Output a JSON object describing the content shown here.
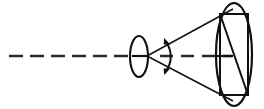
{
  "figure": {
    "background_color": "#ffffff",
    "stroke_color": "#111111",
    "axis_color": "#2b2b2b",
    "width": 264,
    "height": 109
  },
  "elements": {
    "optical_axis": {
      "name": "optical-axis",
      "style": "dashed",
      "dash_length": 14,
      "gap_length": 7,
      "stroke_width": 2.4,
      "y": 56,
      "x_start": 9,
      "x_end": 132
    },
    "axis_right_segment": {
      "name": "optical-axis-right",
      "style": "dashed",
      "dash_length": 13,
      "gap_length": 8,
      "stroke_width": 2.4,
      "y": 56,
      "x_start": 160,
      "x_end": 232
    },
    "lens": {
      "name": "lens-ellipse",
      "cx": 139,
      "cy": 56.5,
      "rx": 9,
      "ry": 20.5,
      "stroke_width": 2.1
    },
    "lens_center_tick": {
      "name": "lens-center-tick",
      "x1": 132,
      "x2": 149,
      "y": 56,
      "stroke_width": 2.2
    },
    "apex": {
      "name": "cone-apex",
      "x": 147,
      "y": 56
    },
    "cone_upper_edge": {
      "name": "cone-upper-edge",
      "x1": 147,
      "y1": 56,
      "x2": 233,
      "y2": 9,
      "stroke_width": 1.5
    },
    "cone_lower_edge": {
      "name": "cone-lower-edge",
      "x1": 147,
      "y1": 56,
      "x2": 233,
      "y2": 101,
      "stroke_width": 1.5
    },
    "angle_arc": {
      "name": "cone-angle-arc",
      "cx": 147,
      "cy": 56,
      "radius": 24,
      "start_x": 165.5,
      "start_y": 40.5,
      "end_x": 165.5,
      "end_y": 72.5,
      "stroke_width": 2.0,
      "arrowheads": "both"
    },
    "aperture": {
      "name": "aperture-ellipse",
      "cx": 234,
      "cy": 54.5,
      "rx": 18,
      "ry": 51.5,
      "stroke_width": 2.2
    },
    "inscribed_rectangle": {
      "name": "inscribed-rectangle",
      "x_left": 220,
      "x_right": 248,
      "y_top": 14,
      "y_bottom": 95,
      "stroke_width": 2.0
    },
    "rectangle_diagonal": {
      "name": "rectangle-diagonal",
      "x1": 220,
      "y1": 14,
      "x2": 248,
      "y2": 95,
      "stroke_width": 2.0
    },
    "aperture_center_tick": {
      "name": "aperture-center-tick",
      "x1": 216,
      "x2": 233,
      "y": 56,
      "stroke_width": 2.2
    }
  }
}
